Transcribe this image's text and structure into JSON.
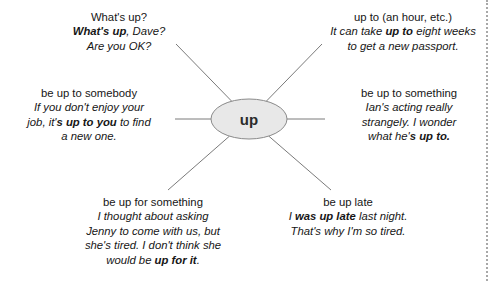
{
  "diagram": {
    "type": "mind-map",
    "center": {
      "label": "up",
      "fill": "#e8e8e8",
      "stroke": "#8a8a8a"
    },
    "line_color": "#6b6b6b",
    "border": {
      "side": "right",
      "style": "dotted",
      "color": "#a8a8a8"
    },
    "branches": [
      {
        "id": "whats-up",
        "position": "top-left",
        "headword": "What's up?",
        "example_lines": [
          [
            {
              "t": "What's up",
              "b": true
            },
            {
              "t": ", Dave?",
              "b": false
            }
          ],
          [
            {
              "t": "Are you OK?",
              "b": false
            }
          ]
        ]
      },
      {
        "id": "up-to-an-hour",
        "position": "top-right",
        "headword": "up to (an hour, etc.)",
        "example_lines": [
          [
            {
              "t": "It can take ",
              "b": false
            },
            {
              "t": "up to",
              "b": true
            },
            {
              "t": " eight weeks",
              "b": false
            }
          ],
          [
            {
              "t": "to get a new passport.",
              "b": false
            }
          ]
        ]
      },
      {
        "id": "be-up-to-somebody",
        "position": "left",
        "headword": "be up to somebody",
        "example_lines": [
          [
            {
              "t": "If you don't enjoy your",
              "b": false
            }
          ],
          [
            {
              "t": "job, it'",
              "b": false
            },
            {
              "t": "s up to you",
              "b": true
            },
            {
              "t": " to find",
              "b": false
            }
          ],
          [
            {
              "t": "a new one.",
              "b": false
            }
          ]
        ]
      },
      {
        "id": "be-up-to-something",
        "position": "right",
        "headword": "be up to something",
        "example_lines": [
          [
            {
              "t": "Ian's acting really",
              "b": false
            }
          ],
          [
            {
              "t": "strangely. I wonder",
              "b": false
            }
          ],
          [
            {
              "t": "what he'",
              "b": false
            },
            {
              "t": "s up to.",
              "b": true
            }
          ]
        ]
      },
      {
        "id": "be-up-for-something",
        "position": "bottom-left",
        "headword": "be up for something",
        "example_lines": [
          [
            {
              "t": "I thought about asking",
              "b": false
            }
          ],
          [
            {
              "t": "Jenny to come with us, but",
              "b": false
            }
          ],
          [
            {
              "t": "she's tired. I don't think she",
              "b": false
            }
          ],
          [
            {
              "t": "would be ",
              "b": false
            },
            {
              "t": "up for it",
              "b": true
            },
            {
              "t": ".",
              "b": false
            }
          ]
        ]
      },
      {
        "id": "be-up-late",
        "position": "bottom-right",
        "headword": "be up late",
        "example_lines": [
          [
            {
              "t": "I ",
              "b": false
            },
            {
              "t": "was up late",
              "b": true
            },
            {
              "t": " last night.",
              "b": false
            }
          ],
          [
            {
              "t": "That's why I'm so tired.",
              "b": false
            }
          ]
        ]
      }
    ]
  }
}
